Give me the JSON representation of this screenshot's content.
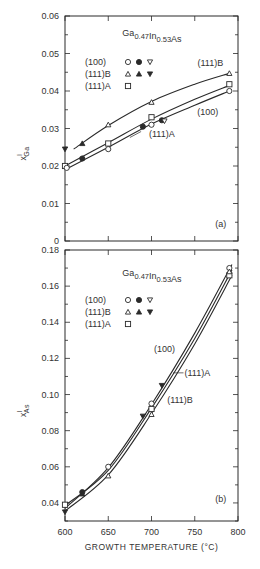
{
  "chart_data": [
    {
      "panel": "(a)",
      "type": "line",
      "title": "Ga0.47In0.53As",
      "title_parts": {
        "base1": "Ga",
        "sub1": "0.47",
        "base2": "In",
        "sub2": "0.53",
        "base3": "As"
      },
      "xlabel": "",
      "ylabel": "x^l_Ga",
      "ylabel_parts": {
        "base": "x",
        "sup": "l",
        "sub": "Ga"
      },
      "xlim": [
        600,
        800
      ],
      "ylim": [
        0,
        0.06
      ],
      "yticks": [
        "0",
        "0.01",
        "0.02",
        "0.03",
        "0.04",
        "0.05",
        "0.06"
      ],
      "yticks_values": [
        0,
        0.01,
        0.02,
        0.03,
        0.04,
        0.05,
        0.06
      ],
      "xticks_values": [
        600,
        650,
        700,
        750,
        800
      ],
      "grid": false,
      "legend": [
        {
          "label": "(100)",
          "markers": [
            "open-circle",
            "filled-circle",
            "open-down-triangle"
          ]
        },
        {
          "label": "(111)B",
          "markers": [
            "open-triangle",
            "filled-triangle",
            "filled-down-triangle"
          ]
        },
        {
          "label": "(111)A",
          "markers": [
            "open-square"
          ]
        }
      ],
      "series": [
        {
          "name": "(111)B",
          "curve": [
            [
              610,
              0.0245
            ],
            [
              650,
              0.0308
            ],
            [
              700,
              0.0372
            ],
            [
              750,
              0.0418
            ],
            [
              790,
              0.0447
            ]
          ],
          "points": [
            {
              "x": 650,
              "y": 0.031,
              "marker": "open-triangle"
            },
            {
              "x": 700,
              "y": 0.037,
              "marker": "open-triangle"
            },
            {
              "x": 790,
              "y": 0.0447,
              "marker": "open-triangle"
            },
            {
              "x": 620,
              "y": 0.026,
              "marker": "filled-triangle"
            },
            {
              "x": 600,
              "y": 0.0245,
              "marker": "filled-down-triangle"
            }
          ]
        },
        {
          "name": "(111)A",
          "curve": [
            [
              600,
              0.02
            ],
            [
              650,
              0.0262
            ],
            [
              700,
              0.0325
            ],
            [
              750,
              0.0378
            ],
            [
              790,
              0.0415
            ]
          ],
          "points": [
            {
              "x": 600,
              "y": 0.02,
              "marker": "open-square"
            },
            {
              "x": 650,
              "y": 0.026,
              "marker": "open-square"
            },
            {
              "x": 700,
              "y": 0.033,
              "marker": "open-square"
            },
            {
              "x": 790,
              "y": 0.0418,
              "marker": "open-square"
            }
          ]
        },
        {
          "name": "(100)",
          "curve": [
            [
              600,
              0.019
            ],
            [
              650,
              0.025
            ],
            [
              700,
              0.0312
            ],
            [
              750,
              0.0362
            ],
            [
              790,
              0.04
            ]
          ],
          "points": [
            {
              "x": 602,
              "y": 0.0195,
              "marker": "open-circle"
            },
            {
              "x": 650,
              "y": 0.0245,
              "marker": "open-circle"
            },
            {
              "x": 700,
              "y": 0.031,
              "marker": "open-circle"
            },
            {
              "x": 790,
              "y": 0.04,
              "marker": "open-circle"
            },
            {
              "x": 620,
              "y": 0.022,
              "marker": "filled-circle"
            },
            {
              "x": 690,
              "y": 0.0305,
              "marker": "filled-circle"
            },
            {
              "x": 712,
              "y": 0.0322,
              "marker": "filled-circle"
            },
            {
              "x": 715,
              "y": 0.032,
              "marker": "open-down-triangle"
            }
          ]
        }
      ],
      "annotations": [
        {
          "text": "(111)B",
          "x": 768,
          "y": 0.0475
        },
        {
          "text": "(100)",
          "x": 765,
          "y": 0.0345
        },
        {
          "text": "(111)A",
          "x": 712,
          "y": 0.0285
        },
        {
          "text": "(a)",
          "x": 780,
          "y": 0.0045
        }
      ]
    },
    {
      "panel": "(b)",
      "type": "line",
      "title": "Ga0.47In0.53As",
      "title_parts": {
        "base1": "Ga",
        "sub1": "0.47",
        "base2": "In",
        "sub2": "0.53",
        "base3": "As"
      },
      "xlabel": "GROWTH TEMPERATURE (°C)",
      "ylabel": "x^l_As",
      "ylabel_parts": {
        "base": "x",
        "sup": "l",
        "sub": "As"
      },
      "xlim": [
        600,
        800
      ],
      "ylim": [
        0.03,
        0.18
      ],
      "xticks": [
        "600",
        "650",
        "700",
        "750",
        "800"
      ],
      "xticks_values": [
        600,
        650,
        700,
        750,
        800
      ],
      "yticks": [
        "0.04",
        "0.06",
        "0.08",
        "0.10",
        "0.12",
        "0.14",
        "0.16",
        "0.18"
      ],
      "yticks_values": [
        0.04,
        0.06,
        0.08,
        0.1,
        0.12,
        0.14,
        0.16,
        0.18
      ],
      "grid": false,
      "legend": [
        {
          "label": "(100)",
          "markers": [
            "open-circle",
            "filled-circle",
            "open-down-triangle"
          ]
        },
        {
          "label": "(111)B",
          "markers": [
            "open-triangle",
            "filled-triangle",
            "filled-down-triangle"
          ]
        },
        {
          "label": "(111)A",
          "markers": [
            "open-square"
          ]
        }
      ],
      "series": [
        {
          "name": "(100)",
          "curve": [
            [
              600,
              0.037
            ],
            [
              650,
              0.0595
            ],
            [
              700,
              0.0945
            ],
            [
              750,
              0.134
            ],
            [
              793,
              0.172
            ]
          ],
          "points": [
            {
              "x": 650,
              "y": 0.06,
              "marker": "open-circle"
            },
            {
              "x": 700,
              "y": 0.095,
              "marker": "open-circle"
            },
            {
              "x": 790,
              "y": 0.17,
              "marker": "open-circle"
            },
            {
              "x": 620,
              "y": 0.046,
              "marker": "filled-circle"
            }
          ]
        },
        {
          "name": "(111)A",
          "curve": [
            [
              600,
              0.0385
            ],
            [
              650,
              0.058
            ],
            [
              700,
              0.0925
            ],
            [
              750,
              0.131
            ],
            [
              793,
              0.169
            ]
          ],
          "points": [
            {
              "x": 600,
              "y": 0.039,
              "marker": "open-square"
            },
            {
              "x": 700,
              "y": 0.092,
              "marker": "open-square"
            },
            {
              "x": 790,
              "y": 0.166,
              "marker": "open-square"
            }
          ]
        },
        {
          "name": "(111)B",
          "curve": [
            [
              600,
              0.0355
            ],
            [
              650,
              0.0555
            ],
            [
              700,
              0.0895
            ],
            [
              750,
              0.128
            ],
            [
              793,
              0.166
            ]
          ],
          "points": [
            {
              "x": 650,
              "y": 0.055,
              "marker": "open-triangle"
            },
            {
              "x": 700,
              "y": 0.089,
              "marker": "open-triangle"
            },
            {
              "x": 790,
              "y": 0.168,
              "marker": "open-triangle"
            },
            {
              "x": 620,
              "y": 0.045,
              "marker": "filled-triangle"
            },
            {
              "x": 600,
              "y": 0.035,
              "marker": "filled-down-triangle"
            },
            {
              "x": 690,
              "y": 0.088,
              "marker": "filled-down-triangle"
            },
            {
              "x": 712,
              "y": 0.105,
              "marker": "filled-down-triangle"
            }
          ]
        }
      ],
      "annotations": [
        {
          "text": "(100)",
          "x": 715,
          "y": 0.125
        },
        {
          "text": "(111)A",
          "x": 753,
          "y": 0.112
        },
        {
          "text": "(111)B",
          "x": 733,
          "y": 0.097
        },
        {
          "text": "(b)",
          "x": 780,
          "y": 0.042
        }
      ]
    }
  ]
}
